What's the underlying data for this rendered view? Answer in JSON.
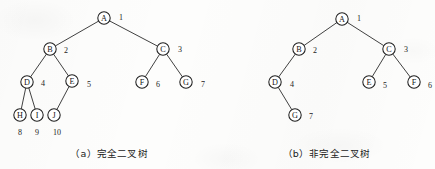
{
  "figure": {
    "width": 435,
    "height": 169,
    "background_color": "#fdfdfc",
    "ink_color": "#1f1f1f"
  },
  "panels": [
    {
      "id": "panel-a",
      "caption": "（a）完全二叉树",
      "caption_label": "(a)",
      "caption_text": "完全二叉树",
      "nodes": [
        {
          "key": "A",
          "label": "A",
          "index": "1",
          "cx": 104,
          "cy": 18,
          "r": 6.2,
          "ix": 121,
          "iy": 17
        },
        {
          "key": "B",
          "label": "B",
          "index": "2",
          "cx": 50,
          "cy": 49,
          "r": 6.2,
          "ix": 66,
          "iy": 50
        },
        {
          "key": "C",
          "label": "C",
          "index": "3",
          "cx": 163,
          "cy": 49,
          "r": 6.2,
          "ix": 180,
          "iy": 49
        },
        {
          "key": "D",
          "label": "D",
          "index": "4",
          "cx": 27,
          "cy": 82,
          "r": 6.2,
          "ix": 43,
          "iy": 83
        },
        {
          "key": "E",
          "label": "E",
          "index": "5",
          "cx": 72,
          "cy": 81,
          "r": 6.2,
          "ix": 89,
          "iy": 84
        },
        {
          "key": "F",
          "label": "F",
          "index": "6",
          "cx": 142,
          "cy": 82,
          "r": 6.2,
          "ix": 158,
          "iy": 84
        },
        {
          "key": "G",
          "label": "G",
          "index": "7",
          "cx": 186,
          "cy": 82,
          "r": 6.2,
          "ix": 203,
          "iy": 84
        },
        {
          "key": "H",
          "label": "H",
          "index": "8",
          "cx": 20,
          "cy": 115,
          "r": 6.2,
          "ix": 20,
          "iy": 132
        },
        {
          "key": "I",
          "label": "I",
          "index": "9",
          "cx": 37,
          "cy": 115,
          "r": 6.2,
          "ix": 37,
          "iy": 132
        },
        {
          "key": "J",
          "label": "J",
          "index": "10",
          "cx": 54,
          "cy": 115,
          "r": 6.2,
          "ix": 57,
          "iy": 132
        }
      ],
      "edges": [
        {
          "from": "A",
          "to": "B"
        },
        {
          "from": "A",
          "to": "C"
        },
        {
          "from": "B",
          "to": "D"
        },
        {
          "from": "B",
          "to": "E"
        },
        {
          "from": "C",
          "to": "F"
        },
        {
          "from": "C",
          "to": "G"
        },
        {
          "from": "D",
          "to": "H"
        },
        {
          "from": "D",
          "to": "I"
        },
        {
          "from": "E",
          "to": "J"
        }
      ]
    },
    {
      "id": "panel-b",
      "caption": "（b）非完全二叉树",
      "caption_label": "(b)",
      "caption_text": "非完全二叉树",
      "nodes": [
        {
          "key": "A",
          "label": "A",
          "index": "1",
          "cx": 342,
          "cy": 19,
          "r": 6.2,
          "ix": 359,
          "iy": 18
        },
        {
          "key": "B",
          "label": "B",
          "index": "2",
          "cx": 299,
          "cy": 49,
          "r": 6.2,
          "ix": 315,
          "iy": 50
        },
        {
          "key": "C",
          "label": "C",
          "index": "3",
          "cx": 389,
          "cy": 49,
          "r": 6.2,
          "ix": 406,
          "iy": 49
        },
        {
          "key": "D",
          "label": "D",
          "index": "4",
          "cx": 275,
          "cy": 82,
          "r": 6.2,
          "ix": 292,
          "iy": 84
        },
        {
          "key": "E",
          "label": "E",
          "index": "5",
          "cx": 369,
          "cy": 82,
          "r": 6.2,
          "ix": 385,
          "iy": 85
        },
        {
          "key": "F",
          "label": "F",
          "index": "6",
          "cx": 414,
          "cy": 82,
          "r": 6.2,
          "ix": 430,
          "iy": 85
        },
        {
          "key": "G",
          "label": "G",
          "index": "7",
          "cx": 295,
          "cy": 115,
          "r": 6.2,
          "ix": 311,
          "iy": 116
        }
      ],
      "edges": [
        {
          "from": "A",
          "to": "B"
        },
        {
          "from": "A",
          "to": "C"
        },
        {
          "from": "B",
          "to": "D"
        },
        {
          "from": "C",
          "to": "E"
        },
        {
          "from": "C",
          "to": "F"
        },
        {
          "from": "D",
          "to": "G"
        }
      ]
    }
  ]
}
